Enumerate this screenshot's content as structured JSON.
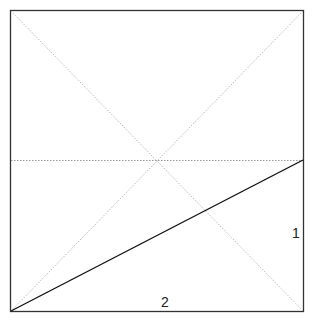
{
  "diagram": {
    "type": "geometric-figure",
    "square": {
      "x": 10,
      "y": 10,
      "size": 293,
      "stroke": "#333333"
    },
    "diagonals": {
      "stroke": "#bbbbbb",
      "style": "dotted"
    },
    "midline": {
      "y": 160,
      "stroke": "#999999",
      "style": "dotted"
    },
    "segment": {
      "from": [
        10,
        311
      ],
      "to": [
        303,
        160
      ],
      "stroke": "#111111"
    },
    "labels": {
      "right_side": "1",
      "bottom_side": "2"
    }
  }
}
